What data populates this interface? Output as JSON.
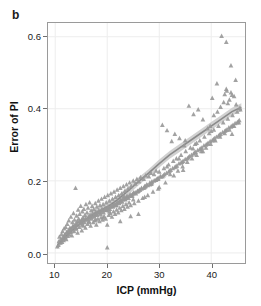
{
  "figure": {
    "panel_label": "b",
    "background_color": "#ffffff",
    "frame_color": "#9a9a9a",
    "marker_color": "#989898",
    "fit_line_color": "#8a8a8a",
    "fit_band_color": "#c9c9c9",
    "grid_color": "#ededed"
  },
  "chart_data": {
    "type": "scatter",
    "title": "",
    "xlabel": "ICP (mmHg)",
    "ylabel": "Error of PI",
    "xlim": [
      8.6,
      46.5
    ],
    "ylim": [
      -0.028,
      0.638
    ],
    "xticks": [
      10,
      20,
      30,
      40
    ],
    "yticks": [
      0.0,
      0.2,
      0.4,
      0.6
    ],
    "xtick_labels": [
      "10",
      "20",
      "30",
      "40"
    ],
    "ytick_labels": [
      "0.0",
      "0.2",
      "0.4",
      "0.6"
    ],
    "grid": true,
    "legend": null,
    "marker": "triangle",
    "series": [
      {
        "name": "Error of PI vs ICP",
        "x": [
          10.4,
          10.6,
          10.7,
          10.8,
          11.0,
          11.1,
          11.2,
          11.3,
          11.4,
          11.5,
          11.6,
          11.7,
          11.8,
          11.9,
          12.0,
          12.1,
          12.2,
          12.3,
          12.4,
          12.5,
          12.6,
          12.7,
          12.8,
          12.9,
          13.0,
          13.1,
          13.2,
          13.3,
          13.4,
          13.5,
          13.6,
          13.7,
          13.8,
          13.9,
          14.0,
          14.1,
          14.2,
          14.3,
          14.4,
          14.5,
          14.6,
          14.7,
          14.8,
          14.9,
          15.0,
          15.1,
          15.2,
          15.3,
          15.4,
          15.5,
          15.6,
          15.7,
          15.8,
          15.9,
          16.0,
          16.1,
          16.2,
          16.3,
          16.4,
          16.5,
          16.6,
          16.7,
          16.8,
          16.9,
          17.0,
          17.1,
          17.2,
          17.3,
          17.4,
          17.5,
          17.6,
          17.7,
          17.8,
          17.9,
          18.0,
          18.1,
          18.2,
          18.3,
          18.4,
          18.5,
          18.6,
          18.7,
          18.8,
          18.9,
          19.0,
          19.1,
          19.2,
          19.3,
          19.4,
          19.5,
          19.6,
          19.7,
          19.8,
          19.9,
          20.0,
          20.1,
          20.2,
          20.3,
          20.4,
          20.5,
          20.6,
          20.7,
          20.8,
          20.9,
          21.0,
          21.1,
          21.2,
          21.3,
          21.4,
          21.5,
          21.6,
          21.7,
          21.8,
          21.9,
          22.0,
          22.1,
          22.2,
          22.3,
          22.4,
          22.5,
          22.6,
          22.7,
          22.8,
          22.9,
          23.0,
          23.1,
          23.2,
          23.3,
          23.4,
          23.5,
          23.6,
          23.7,
          23.8,
          23.9,
          24.0,
          24.1,
          24.2,
          24.3,
          24.4,
          24.5,
          24.6,
          24.8,
          25.0,
          25.1,
          25.2,
          25.4,
          25.5,
          25.7,
          25.8,
          26.0,
          26.1,
          26.3,
          26.4,
          26.6,
          26.8,
          27.0,
          27.2,
          27.4,
          27.6,
          27.8,
          28.0,
          28.2,
          28.4,
          28.6,
          28.8,
          29.0,
          29.2,
          29.4,
          29.6,
          29.8,
          30.0,
          30.3,
          30.6,
          30.9,
          31.2,
          31.5,
          31.8,
          32.1,
          32.4,
          32.7,
          33.0,
          33.3,
          33.6,
          33.9,
          34.2,
          34.5,
          34.8,
          35.1,
          35.4,
          35.7,
          36.0,
          36.3,
          36.6,
          36.9,
          37.2,
          37.5,
          37.8,
          38.1,
          38.4,
          38.7,
          39.0,
          39.3,
          39.6,
          39.9,
          40.2,
          40.5,
          40.8,
          41.1,
          41.4,
          41.7,
          42.0,
          42.3,
          42.6,
          42.9,
          43.2,
          43.5,
          43.8,
          44.1,
          44.4,
          44.7,
          45.0,
          45.3,
          45.6,
          12.2,
          13.4,
          14.6,
          15.8,
          17.0,
          18.2,
          19.4,
          20.6,
          21.8,
          23.0,
          24.2,
          25.4,
          26.6,
          27.8,
          29.0,
          30.2,
          31.4,
          32.6,
          33.8,
          35.0,
          36.2,
          37.4,
          38.6,
          39.8,
          41.0,
          42.2,
          43.4,
          44.6,
          13.0,
          14.2,
          15.4,
          16.6,
          17.8,
          19.0,
          20.2,
          21.4,
          22.6,
          23.8,
          25.0,
          26.2,
          27.4,
          28.6,
          29.8,
          31.0,
          32.2,
          33.4,
          34.6,
          35.8,
          37.0,
          38.2,
          39.4,
          40.6,
          41.8,
          43.0,
          44.2,
          45.4,
          11.5,
          12.8,
          14.0,
          15.2,
          16.4,
          17.6,
          18.8,
          20.0,
          21.2,
          22.4,
          23.6,
          24.8,
          26.0,
          27.2,
          28.4,
          29.6,
          30.8,
          32.0,
          33.2,
          34.4,
          35.6,
          36.8,
          38.0,
          39.2,
          40.4,
          41.6,
          42.8,
          44.0,
          45.2,
          13.6,
          15.0,
          16.2,
          17.4,
          18.6,
          19.8,
          21.0,
          22.2,
          23.4,
          24.6,
          25.8,
          27.0,
          28.2,
          29.4,
          30.6,
          31.8,
          33.0,
          34.2,
          35.4,
          36.6,
          37.8,
          39.0,
          40.2,
          41.4,
          42.6,
          43.8,
          45.0,
          42.6,
          42.9,
          43.5,
          43.8,
          44.4,
          41.8,
          42.4,
          43.0,
          44.8,
          45.5,
          40.5,
          41.2,
          39.8,
          43.2,
          44.0,
          36.5,
          37.2,
          38.4,
          33.8,
          34.6,
          31.5,
          32.8,
          29.8,
          28.5,
          27.2,
          26.0,
          24.5,
          23.2,
          21.8,
          20.4,
          19.2,
          17.8,
          16.5,
          15.2,
          14.0,
          12.8,
          11.8,
          20.0,
          22.5,
          25.0,
          30.0,
          35.0,
          40.0,
          44.0
        ],
        "y": [
          0.018,
          0.022,
          0.032,
          0.045,
          0.028,
          0.038,
          0.052,
          0.03,
          0.06,
          0.041,
          0.035,
          0.068,
          0.05,
          0.043,
          0.072,
          0.038,
          0.055,
          0.08,
          0.047,
          0.062,
          0.09,
          0.051,
          0.07,
          0.058,
          0.1,
          0.065,
          0.048,
          0.085,
          0.074,
          0.11,
          0.06,
          0.092,
          0.078,
          0.18,
          0.068,
          0.103,
          0.088,
          0.056,
          0.12,
          0.095,
          0.072,
          0.108,
          0.082,
          0.13,
          0.09,
          0.062,
          0.115,
          0.098,
          0.075,
          0.122,
          0.085,
          0.105,
          0.07,
          0.135,
          0.092,
          0.112,
          0.08,
          0.125,
          0.098,
          0.088,
          0.14,
          0.105,
          0.075,
          0.118,
          0.095,
          0.13,
          0.11,
          0.085,
          0.122,
          0.1,
          0.09,
          0.138,
          0.115,
          0.078,
          0.128,
          0.105,
          0.095,
          0.145,
          0.118,
          0.088,
          0.132,
          0.108,
          0.098,
          0.15,
          0.122,
          0.092,
          0.135,
          0.112,
          0.102,
          0.155,
          0.125,
          0.095,
          0.14,
          0.118,
          0.015,
          0.16,
          0.128,
          0.105,
          0.145,
          0.122,
          0.11,
          0.165,
          0.132,
          0.1,
          0.15,
          0.128,
          0.115,
          0.17,
          0.138,
          0.108,
          0.155,
          0.132,
          0.12,
          0.175,
          0.142,
          0.112,
          0.16,
          0.138,
          0.125,
          0.18,
          0.148,
          0.118,
          0.165,
          0.142,
          0.13,
          0.185,
          0.152,
          0.122,
          0.172,
          0.148,
          0.135,
          0.19,
          0.158,
          0.128,
          0.178,
          0.152,
          0.14,
          0.195,
          0.162,
          0.132,
          0.185,
          0.158,
          0.2,
          0.168,
          0.138,
          0.192,
          0.165,
          0.205,
          0.172,
          0.145,
          0.198,
          0.175,
          0.21,
          0.18,
          0.152,
          0.205,
          0.185,
          0.215,
          0.19,
          0.16,
          0.212,
          0.195,
          0.222,
          0.198,
          0.17,
          0.218,
          0.202,
          0.228,
          0.205,
          0.178,
          0.225,
          0.212,
          0.355,
          0.235,
          0.195,
          0.34,
          0.245,
          0.218,
          0.31,
          0.255,
          0.33,
          0.262,
          0.228,
          0.318,
          0.272,
          0.24,
          0.298,
          0.282,
          0.252,
          0.408,
          0.292,
          0.262,
          0.385,
          0.302,
          0.272,
          0.398,
          0.312,
          0.282,
          0.37,
          0.322,
          0.292,
          0.345,
          0.332,
          0.302,
          0.43,
          0.342,
          0.312,
          0.47,
          0.352,
          0.322,
          0.602,
          0.362,
          0.332,
          0.585,
          0.372,
          0.342,
          0.52,
          0.382,
          0.352,
          0.48,
          0.392,
          0.362,
          0.398,
          0.058,
          0.075,
          0.088,
          0.095,
          0.102,
          0.112,
          0.12,
          0.128,
          0.138,
          0.148,
          0.158,
          0.168,
          0.178,
          0.188,
          0.2,
          0.212,
          0.222,
          0.235,
          0.248,
          0.26,
          0.272,
          0.285,
          0.298,
          0.31,
          0.322,
          0.335,
          0.348,
          0.36,
          0.068,
          0.082,
          0.092,
          0.1,
          0.108,
          0.118,
          0.126,
          0.136,
          0.145,
          0.155,
          0.165,
          0.175,
          0.185,
          0.195,
          0.208,
          0.218,
          0.23,
          0.242,
          0.255,
          0.268,
          0.28,
          0.292,
          0.305,
          0.318,
          0.33,
          0.342,
          0.355,
          0.368,
          0.04,
          0.062,
          0.078,
          0.09,
          0.098,
          0.106,
          0.115,
          0.124,
          0.132,
          0.142,
          0.152,
          0.162,
          0.172,
          0.182,
          0.192,
          0.205,
          0.215,
          0.228,
          0.24,
          0.252,
          0.265,
          0.278,
          0.29,
          0.302,
          0.315,
          0.328,
          0.34,
          0.352,
          0.365,
          0.072,
          0.086,
          0.094,
          0.104,
          0.112,
          0.12,
          0.13,
          0.14,
          0.15,
          0.16,
          0.17,
          0.18,
          0.19,
          0.202,
          0.212,
          0.225,
          0.238,
          0.25,
          0.262,
          0.275,
          0.288,
          0.3,
          0.312,
          0.325,
          0.338,
          0.35,
          0.362,
          0.44,
          0.455,
          0.425,
          0.445,
          0.435,
          0.405,
          0.418,
          0.45,
          0.412,
          0.402,
          0.382,
          0.392,
          0.352,
          0.415,
          0.438,
          0.29,
          0.305,
          0.282,
          0.262,
          0.23,
          0.24,
          0.215,
          0.205,
          0.192,
          0.155,
          0.108,
          0.102,
          0.158,
          0.132,
          0.115,
          0.098,
          0.092,
          0.085,
          0.078,
          0.068,
          0.06,
          0.05,
          0.078,
          0.088,
          0.148,
          0.182,
          0.312,
          0.338,
          0.33
        ]
      }
    ],
    "fit_line": {
      "name": "loess-fit",
      "x": [
        10.4,
        12.0,
        14.0,
        16.0,
        18.0,
        20.0,
        22.0,
        24.0,
        26.0,
        28.0,
        30.0,
        32.0,
        34.0,
        36.0,
        38.0,
        40.0,
        42.0,
        44.0,
        45.8
      ],
      "y": [
        0.022,
        0.046,
        0.072,
        0.095,
        0.112,
        0.128,
        0.148,
        0.172,
        0.198,
        0.222,
        0.248,
        0.272,
        0.292,
        0.312,
        0.332,
        0.352,
        0.372,
        0.392,
        0.404
      ],
      "band_halfwidth": 0.011
    }
  }
}
